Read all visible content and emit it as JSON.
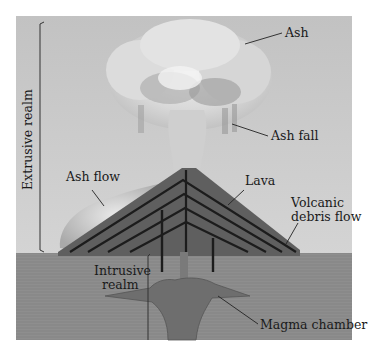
{
  "diagram": {
    "labels": {
      "ash": "Ash",
      "ash_fall": "Ash fall",
      "ash_flow": "Ash flow",
      "lava": "Lava",
      "volcanic_debris_flow_line1": "Volcanic",
      "volcanic_debris_flow_line2": "debris flow",
      "intrusive_realm_line1": "Intrusive",
      "intrusive_realm_line2": "realm",
      "magma_chamber": "Magma chamber",
      "extrusive_realm": "Extrusive realm"
    },
    "colors": {
      "sky": "#c9c9c9",
      "ground": "#8d8d8d",
      "cone": "#5e5e5e",
      "lava_lines": "#1c1c1c",
      "ash_cloud": "#d8d8d8",
      "magma": "#6e6e6e",
      "label_text": "#1a1a1a"
    }
  }
}
